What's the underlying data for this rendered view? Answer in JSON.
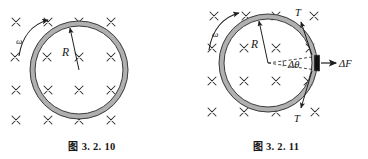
{
  "page": {
    "width": 368,
    "height": 159,
    "background": "#ffffff",
    "ink": "#1a1a1a",
    "ring_fill": "#b3b3b3",
    "ring_stroke": "#3d3d3d",
    "segment_fill": "#111111"
  },
  "figures": [
    {
      "id": "fig-left",
      "caption_prefix": "图",
      "caption_number": "3. 2. 10",
      "caption": "图 3. 2. 10",
      "center": {
        "x": 79,
        "y": 70
      },
      "ring_radius": 49,
      "ring_band_width": 5,
      "field_symbol": "x",
      "field_meaning": "magnetic-field-into-page",
      "field_marks": [
        {
          "x": 16,
          "y": 22
        },
        {
          "x": 48,
          "y": 22
        },
        {
          "x": 79,
          "y": 22
        },
        {
          "x": 111,
          "y": 22
        },
        {
          "x": 15,
          "y": 57
        },
        {
          "x": 47,
          "y": 57
        },
        {
          "x": 79,
          "y": 57
        },
        {
          "x": 111,
          "y": 57
        },
        {
          "x": 16,
          "y": 90
        },
        {
          "x": 48,
          "y": 90
        },
        {
          "x": 79,
          "y": 90
        },
        {
          "x": 111,
          "y": 90
        },
        {
          "x": 16,
          "y": 120
        },
        {
          "x": 48,
          "y": 120
        },
        {
          "x": 79,
          "y": 120
        },
        {
          "x": 111,
          "y": 120
        }
      ],
      "labels": [
        {
          "name": "omega-label",
          "text": "ω",
          "x": 22,
          "y": 41,
          "italic": true,
          "size": 9
        },
        {
          "name": "radius-label",
          "text": "R",
          "x": 66,
          "y": 56,
          "italic": true,
          "size": 11
        }
      ],
      "annotations": {
        "omega_arrow": "counterclockwise-curved-arrow-outside-upper-left",
        "radius_arrow": "arrow-from-center-to-ring-upper-right"
      }
    },
    {
      "id": "fig-right",
      "caption_prefix": "图",
      "caption_number": "3. 2. 11",
      "caption": "图 3. 2. 11",
      "center": {
        "x": 84,
        "y": 63
      },
      "ring_radius": 49,
      "ring_band_width": 5,
      "field_symbol": "x",
      "field_meaning": "magnetic-field-into-page",
      "field_marks": [
        {
          "x": 30,
          "y": 16
        },
        {
          "x": 62,
          "y": 16
        },
        {
          "x": 92,
          "y": 16
        },
        {
          "x": 130,
          "y": 16
        },
        {
          "x": 28,
          "y": 48
        },
        {
          "x": 60,
          "y": 48
        },
        {
          "x": 92,
          "y": 48
        },
        {
          "x": 126,
          "y": 48
        },
        {
          "x": 28,
          "y": 81
        },
        {
          "x": 60,
          "y": 81
        },
        {
          "x": 92,
          "y": 81
        },
        {
          "x": 124,
          "y": 81
        },
        {
          "x": 28,
          "y": 112
        },
        {
          "x": 60,
          "y": 112
        },
        {
          "x": 92,
          "y": 112
        },
        {
          "x": 131,
          "y": 112
        }
      ],
      "labels": [
        {
          "name": "omega-label",
          "text": "ω",
          "x": 34,
          "y": 34,
          "italic": true,
          "size": 9
        },
        {
          "name": "radius-label",
          "text": "R",
          "x": 72,
          "y": 46,
          "italic": true,
          "size": 11
        },
        {
          "name": "tension-top-label",
          "text": "T",
          "x": 114,
          "y": 14,
          "italic": true,
          "size": 10
        },
        {
          "name": "tension-bottom-label",
          "text": "T",
          "x": 113,
          "y": 120,
          "italic": true,
          "size": 10
        },
        {
          "name": "delta-theta-label",
          "text": "Δθ",
          "x": 110,
          "y": 67,
          "italic": true,
          "size": 10
        },
        {
          "name": "delta-force-label",
          "text": "ΔF",
          "x": 155,
          "y": 66,
          "italic": true,
          "size": 10
        }
      ],
      "annotations": {
        "omega_arrow": "counterclockwise-curved-arrow-outside-upper-left",
        "radius_arrow": "arrow-from-center-to-ring-upper-right",
        "tension_arrows": "two-tangential-tension-arrows-at-segment-ends",
        "force_arrow": "outward-radial-arrow-to-the-right",
        "wedge": "dashed-wedge-from-center-subtending-delta-theta",
        "segment": "black-highlighted-ring-element-on-right-edge"
      }
    }
  ]
}
